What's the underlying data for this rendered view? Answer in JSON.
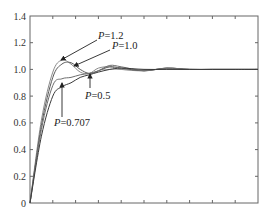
{
  "chart_data": {
    "type": "line",
    "title": "",
    "xlabel": "",
    "ylabel": "",
    "xlim": [
      0,
      10
    ],
    "ylim": [
      0,
      1.4
    ],
    "grid": false,
    "legend": "none (inline annotations with arrows)",
    "yticks": [
      "0",
      "0.2",
      "0.4",
      "0.6",
      "0.8",
      "1.0",
      "1.2",
      "1.4"
    ],
    "xticks_count": 10,
    "xtick_labels_visible": false,
    "series": [
      {
        "name": "P=1.2",
        "x": [
          0,
          0.5,
          1.0,
          1.4,
          1.8,
          2.2,
          2.6,
          3.0,
          3.5,
          4.0,
          5.0,
          6.0,
          7.0,
          8.0,
          9.0,
          10.0
        ],
        "values": [
          0,
          0.62,
          0.98,
          1.07,
          1.04,
          0.98,
          0.97,
          1.01,
          1.02,
          1.0,
          0.99,
          1.01,
          1.0,
          1.0,
          1.0,
          1.0
        ]
      },
      {
        "name": "P=1.0",
        "x": [
          0,
          0.5,
          1.0,
          1.4,
          1.8,
          2.2,
          2.6,
          3.0,
          3.5,
          4.0,
          5.0,
          6.0,
          7.0,
          8.0,
          9.0,
          10.0
        ],
        "values": [
          0,
          0.58,
          0.94,
          1.04,
          1.05,
          1.0,
          0.97,
          0.99,
          1.02,
          1.01,
          0.99,
          1.01,
          1.0,
          1.0,
          1.0,
          1.0
        ]
      },
      {
        "name": "P=0.707",
        "x": [
          0,
          0.5,
          1.0,
          1.4,
          1.8,
          2.2,
          2.6,
          3.0,
          3.5,
          4.0,
          5.0,
          6.0,
          7.0,
          8.0,
          9.0,
          10.0
        ],
        "values": [
          0,
          0.55,
          0.88,
          0.93,
          0.94,
          0.96,
          0.97,
          0.99,
          1.03,
          1.02,
          0.99,
          1.01,
          1.0,
          1.0,
          1.0,
          1.0
        ]
      },
      {
        "name": "P=0.5",
        "x": [
          0,
          0.5,
          1.0,
          1.4,
          1.8,
          2.2,
          2.6,
          3.0,
          3.5,
          4.0,
          5.0,
          6.0,
          7.0,
          8.0,
          9.0,
          10.0
        ],
        "values": [
          0,
          0.5,
          0.8,
          0.87,
          0.9,
          0.94,
          0.96,
          0.98,
          1.0,
          1.01,
          1.0,
          1.0,
          1.0,
          1.0,
          1.0,
          1.0
        ]
      }
    ],
    "annotations": [
      {
        "text": "P=1.2",
        "points_to_series": "P=1.2"
      },
      {
        "text": "P=1.0",
        "points_to_series": "P=1.0"
      },
      {
        "text": "P=0.5",
        "points_to_series": "P=0.5"
      },
      {
        "text": "P=0.707",
        "points_to_series": "P=0.707"
      }
    ]
  },
  "labels": {
    "y": [
      "0",
      "0.2",
      "0.4",
      "0.6",
      "0.8",
      "1.0",
      "1.2",
      "1.4"
    ],
    "annot": {
      "p12_var": "P",
      "p12_val": "=1.2",
      "p10_var": "P",
      "p10_val": "=1.0",
      "p05_var": "P",
      "p05_val": "=0.5",
      "p0707_var": "P",
      "p0707_val": "=0.707"
    }
  },
  "colors": {
    "axis": "#555555",
    "curve": "#555555",
    "arrow": "#222222"
  }
}
